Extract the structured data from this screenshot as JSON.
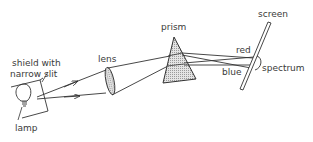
{
  "diagram": {
    "labels": {
      "shield": [
        "shield with",
        "narrow slit"
      ],
      "lamp": "lamp",
      "lens": "lens",
      "prism": "prism",
      "screen": "screen",
      "red": "red",
      "blue": "blue",
      "spectrum": "spectrum"
    },
    "colors": {
      "stroke": "#333333",
      "text": "#3a3a3a",
      "hatch": "#bdbdbd",
      "background": "#ffffff"
    }
  }
}
